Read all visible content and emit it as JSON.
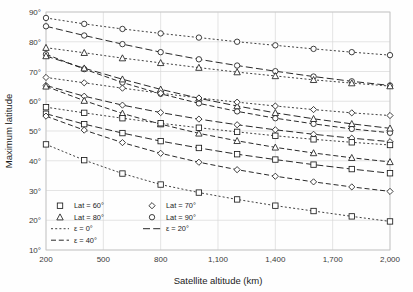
{
  "chart_data": {
    "type": "line",
    "title": "",
    "xlabel": "Satellite altitude (km)",
    "ylabel": "Maximum latitude",
    "xlim": [
      200,
      2000
    ],
    "ylim": [
      10,
      90
    ],
    "grid": true,
    "legend_position": "inside-bottom-left",
    "x_ticks": [
      200,
      500,
      800,
      1100,
      1400,
      1700,
      2000
    ],
    "x_tick_labels": [
      "200",
      "500",
      "800",
      "1,100",
      "1,400",
      "1,700",
      "2,000"
    ],
    "y_ticks": [
      10,
      20,
      30,
      40,
      50,
      60,
      70,
      80,
      90
    ],
    "y_tick_labels": [
      "10°",
      "20°",
      "30°",
      "40°",
      "50°",
      "60°",
      "70°",
      "80°",
      "90°"
    ],
    "x": [
      200,
      400,
      600,
      800,
      1000,
      1200,
      1400,
      1600,
      1800,
      2000
    ],
    "series": [
      {
        "name": "Lat = 90°, ε = 0°",
        "lat": 90,
        "eps": 0,
        "marker": "circle",
        "dash": "dotted",
        "values": [
          88.0,
          86.0,
          84.3,
          82.8,
          81.4,
          80.0,
          78.8,
          77.6,
          76.5,
          75.5
        ]
      },
      {
        "name": "Lat = 90°, ε = 20°",
        "lat": 90,
        "eps": 20,
        "marker": "circle",
        "dash": "long",
        "values": [
          85.2,
          82.1,
          79.2,
          76.5,
          74.1,
          72.0,
          70.1,
          68.3,
          66.7,
          65.3
        ]
      },
      {
        "name": "Lat = 80°, ε = 0°",
        "lat": 80,
        "eps": 0,
        "marker": "triangle",
        "dash": "dotted",
        "values": [
          78.0,
          76.3,
          74.5,
          72.9,
          71.3,
          69.8,
          68.5,
          67.2,
          66.1,
          65.1
        ]
      },
      {
        "name": "Lat = 90°, ε = 40°",
        "lat": 90,
        "eps": 40,
        "marker": "circle",
        "dash": "medium",
        "values": [
          75.8,
          70.8,
          66.3,
          62.5,
          59.3,
          56.6,
          54.3,
          52.4,
          50.7,
          49.4
        ]
      },
      {
        "name": "Lat = 80°, ε = 20°",
        "lat": 80,
        "eps": 20,
        "marker": "triangle",
        "dash": "long",
        "values": [
          75.2,
          71.1,
          67.4,
          64.0,
          61.0,
          58.4,
          56.1,
          54.1,
          52.4,
          50.9
        ]
      },
      {
        "name": "Lat = 70°, ε = 0°",
        "lat": 70,
        "eps": 0,
        "marker": "diamond",
        "dash": "dotted",
        "values": [
          68.0,
          66.2,
          64.4,
          62.7,
          61.1,
          59.7,
          58.4,
          57.2,
          56.1,
          55.2
        ]
      },
      {
        "name": "Lat = 70°, ε = 20°",
        "lat": 70,
        "eps": 20,
        "marker": "diamond",
        "dash": "long",
        "values": [
          65.3,
          61.7,
          58.7,
          56.2,
          54.0,
          52.1,
          50.4,
          48.9,
          47.6,
          46.4
        ]
      },
      {
        "name": "Lat = 80°, ε = 40°",
        "lat": 80,
        "eps": 40,
        "marker": "triangle",
        "dash": "medium",
        "values": [
          65.0,
          60.2,
          55.9,
          52.3,
          49.2,
          46.7,
          44.5,
          42.6,
          41.0,
          39.6
        ]
      },
      {
        "name": "Lat = 60°, ε = 0°",
        "lat": 60,
        "eps": 0,
        "marker": "square",
        "dash": "dotted",
        "values": [
          58.0,
          56.1,
          54.3,
          52.6,
          51.1,
          49.7,
          48.4,
          47.2,
          46.2,
          45.3
        ]
      },
      {
        "name": "Lat = 60°, ε = 20°",
        "lat": 60,
        "eps": 20,
        "marker": "square",
        "dash": "long",
        "values": [
          55.8,
          52.3,
          49.3,
          46.6,
          44.3,
          42.2,
          40.4,
          38.7,
          37.2,
          35.8
        ]
      },
      {
        "name": "Lat = 70°, ε = 40°",
        "lat": 70,
        "eps": 40,
        "marker": "diamond",
        "dash": "medium",
        "values": [
          55.0,
          50.3,
          46.1,
          42.5,
          39.5,
          37.0,
          34.8,
          32.9,
          31.2,
          29.7
        ]
      },
      {
        "name": "Lat = 60°, ε = 40°",
        "lat": 60,
        "eps": 40,
        "marker": "square",
        "dash": "dotted",
        "values": [
          45.5,
          40.2,
          35.7,
          32.0,
          29.3,
          27.0,
          24.9,
          23.1,
          21.3,
          19.6
        ]
      }
    ],
    "legend": {
      "markers": [
        {
          "label": "Lat = 60°",
          "shape": "square"
        },
        {
          "label": "Lat = 70°",
          "shape": "diamond"
        },
        {
          "label": "Lat = 80°",
          "shape": "triangle"
        },
        {
          "label": "Lat = 90°",
          "shape": "circle"
        }
      ],
      "lines": [
        {
          "label": "ε = 0°",
          "dash": "dotted"
        },
        {
          "label": "ε = 20°",
          "dash": "long"
        },
        {
          "label": "ε = 40°",
          "dash": "medium"
        }
      ]
    },
    "colors": {
      "line": "#1d1d1d",
      "grid": "#d8d8d8",
      "marker_fill": "#ffffff",
      "background": "#fefefe"
    }
  }
}
